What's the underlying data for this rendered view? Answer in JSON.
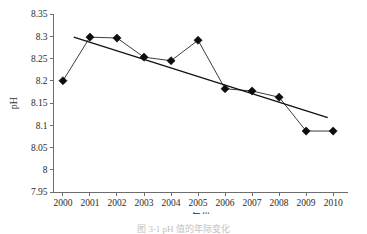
{
  "figure": {
    "background": "#ffffff",
    "caption": "图 3-1  pH 值的年际变化"
  },
  "chart_data": {
    "type": "line",
    "title": "",
    "xlabel": "年份",
    "ylabel": "pH",
    "x": [
      2000,
      2001,
      2002,
      2003,
      2004,
      2005,
      2006,
      2007,
      2008,
      2009,
      2010
    ],
    "categories": [
      "2000",
      "2001",
      "2002",
      "2003",
      "2004",
      "2005",
      "2006",
      "2007",
      "2008",
      "2009",
      "2010"
    ],
    "values": [
      8.2,
      8.298,
      8.296,
      8.253,
      8.245,
      8.291,
      8.182,
      8.177,
      8.163,
      8.087,
      8.087
    ],
    "series": [
      {
        "name": "pH",
        "marker": "diamond",
        "color": "#0d0d0d",
        "values": [
          8.2,
          8.298,
          8.296,
          8.253,
          8.245,
          8.291,
          8.182,
          8.177,
          8.163,
          8.087,
          8.087
        ]
      },
      {
        "name": "trendline",
        "marker": "none",
        "color": "#111111",
        "x": [
          2000.4,
          2009.8
        ],
        "values": [
          8.298,
          8.117
        ]
      }
    ],
    "xlim": [
      1999.65,
      2010.55
    ],
    "ylim": [
      7.95,
      8.35
    ],
    "xticks": [
      2000,
      2001,
      2002,
      2003,
      2004,
      2005,
      2006,
      2007,
      2008,
      2009,
      2010
    ],
    "xticklabels": [
      "2000",
      "2001",
      "2002",
      "2003",
      "2004",
      "2005",
      "2006",
      "2007",
      "2008",
      "2009",
      "2010"
    ],
    "yticks": [
      7.95,
      8.0,
      8.05,
      8.1,
      8.15,
      8.2,
      8.25,
      8.3,
      8.35
    ],
    "yticklabels": [
      "7.95",
      "8",
      "8.05",
      "8.1",
      "8.15",
      "8.2",
      "8.25",
      "8.3",
      "8.35"
    ],
    "grid": false,
    "legend": false,
    "legend_position": "none",
    "spines": [
      "left",
      "bottom"
    ],
    "tick_direction": "out"
  }
}
